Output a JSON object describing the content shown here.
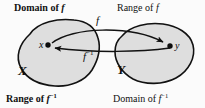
{
  "figure": {
    "background_color": "#fbfbfb",
    "blob_fill_color": "#dedede",
    "blob_stroke_color": "#111111",
    "text_color": "#111111"
  },
  "captions": {
    "top_left": {
      "text": "Domain of ",
      "symbol": "f",
      "exponent": ""
    },
    "top_right": {
      "text": "Range of ",
      "symbol": "f",
      "exponent": ""
    },
    "bottom_left": {
      "text": "Range of ",
      "symbol": "f",
      "exponent": "−1"
    },
    "bottom_right": {
      "text": "Domain of ",
      "symbol": "f",
      "exponent": "−1"
    }
  },
  "sets": {
    "left": {
      "name": "X",
      "element_label": "x"
    },
    "right": {
      "name": "Y",
      "element_label": "y"
    }
  },
  "arrows": {
    "forward": {
      "label": "f",
      "exponent": "",
      "from": "x",
      "to": "y"
    },
    "inverse": {
      "label": "f",
      "exponent": "−1",
      "from": "y",
      "to": "x"
    }
  }
}
